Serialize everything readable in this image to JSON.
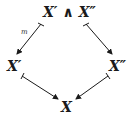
{
  "diagram": {
    "type": "commutative-diagram",
    "nodes": {
      "top": "X′ ∧ X″",
      "left": "X′",
      "right": "X″",
      "bottom": "X"
    },
    "edges": [
      {
        "from": "top",
        "to": "left",
        "label": "m",
        "style": "mono-arrow"
      },
      {
        "from": "top",
        "to": "right",
        "label": "",
        "style": "mono-arrow"
      },
      {
        "from": "left",
        "to": "bottom",
        "label": "",
        "style": "mono-arrow"
      },
      {
        "from": "right",
        "to": "bottom",
        "label": "",
        "style": "mono-arrow"
      }
    ],
    "colors": {
      "ink": "#1a1a1a",
      "background": "#ffffff"
    }
  }
}
